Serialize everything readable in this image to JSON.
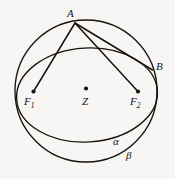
{
  "figure": {
    "kind": "geometry-diagram",
    "canvas": {
      "width": 175,
      "height": 179
    },
    "stroke_color": "#17120d",
    "background_color": "#f7f6f4",
    "points": [
      {
        "id": "A",
        "label": "A",
        "x": 75,
        "y": 23,
        "dot": false
      },
      {
        "id": "B",
        "label": "B",
        "x": 152,
        "y": 70,
        "dot": false
      },
      {
        "id": "F1",
        "label": "F",
        "sub": "1",
        "x": 33,
        "y": 92,
        "dot": true
      },
      {
        "id": "Z",
        "label": "Z",
        "x": 86,
        "y": 89,
        "dot": true
      },
      {
        "id": "F2",
        "label": "F",
        "sub": "2",
        "x": 138,
        "y": 92,
        "dot": true
      }
    ],
    "curves": [
      {
        "id": "sphere-outline",
        "label": "",
        "type": "circle",
        "cx": 86,
        "cy": 91,
        "r": 71
      },
      {
        "id": "circle-alpha",
        "label": "α",
        "type": "ellipse",
        "cx": 87,
        "cy": 95,
        "rx": 70,
        "ry": 47,
        "rotation": -3
      },
      {
        "id": "ellipse-beta",
        "label": "β",
        "type": "ellipse",
        "cx": 86,
        "cy": 91,
        "rx": 71,
        "ry": 71,
        "rotation": 0
      }
    ],
    "segments": [
      {
        "id": "A-F1",
        "from": "A",
        "to": "F1"
      },
      {
        "id": "A-F2",
        "from": "A",
        "to": "F2"
      },
      {
        "id": "A-B",
        "from": "A",
        "to": "B"
      },
      {
        "id": "B-F2",
        "from": "B",
        "to": "F2"
      }
    ],
    "labels": {
      "A": "A",
      "B": "B",
      "F1_base": "F",
      "F1_sub": "1",
      "Z": "Z",
      "F2_base": "F",
      "F2_sub": "2",
      "alpha": "α",
      "beta": "β"
    }
  }
}
